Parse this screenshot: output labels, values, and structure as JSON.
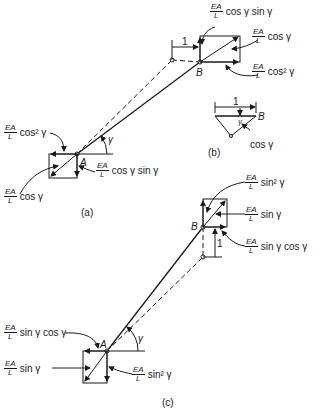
{
  "figure": {
    "panels": [
      {
        "id": "a",
        "caption": "(a)"
      },
      {
        "id": "b",
        "caption": "(b)"
      },
      {
        "id": "c",
        "caption": "(c)"
      }
    ],
    "fraction": {
      "num": "EA",
      "den": "L"
    },
    "angle_symbol": "γ",
    "unit_label": "1",
    "nodes": {
      "A": "A",
      "B": "B"
    },
    "panel_a": {
      "B_labels": [
        {
          "expr": "cos γ sin γ"
        },
        {
          "expr": "cos γ"
        },
        {
          "expr": "cos² γ"
        }
      ],
      "A_labels": [
        {
          "expr": "cos² γ"
        },
        {
          "expr": "cos γ sin γ"
        },
        {
          "expr": "cos γ"
        }
      ]
    },
    "panel_b": {
      "label": "cos γ"
    },
    "panel_c": {
      "B_labels": [
        {
          "expr": "sin² γ"
        },
        {
          "expr": "sin  γ"
        },
        {
          "expr": "sin  γ cos γ"
        }
      ],
      "A_labels": [
        {
          "expr": "sin γ cos γ"
        },
        {
          "expr": "sin γ"
        },
        {
          "expr": "sin² γ"
        }
      ]
    }
  }
}
